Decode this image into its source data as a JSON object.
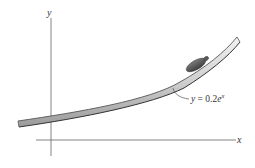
{
  "diagram": {
    "axes": {
      "x_label": "x",
      "y_label": "y"
    },
    "curve": {
      "equation_prefix": "y = 0.2",
      "equation_base": "e",
      "equation_exponent": "x",
      "description": "track shaped along exponential curve"
    },
    "object": {
      "description": "small object sliding along the curved track"
    },
    "colors": {
      "axis": "#555555",
      "track_outline": "#444444",
      "track_fill": "#cfcfcf",
      "object": "#5a5a5a"
    }
  }
}
